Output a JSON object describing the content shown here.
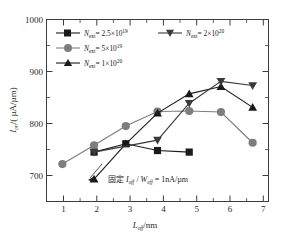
{
  "chart_data": {
    "type": "line",
    "title": "",
    "xlabel": "L_off /nm",
    "ylabel": "I_on /( µA/µm )",
    "x": [
      1,
      2,
      3,
      4,
      5,
      6,
      7
    ],
    "xlim": [
      0.5,
      7.5
    ],
    "ylim": [
      650,
      1000
    ],
    "yticks": [
      700,
      800,
      900,
      1000
    ],
    "xticks": [
      1,
      2,
      3,
      4,
      5,
      6,
      7
    ],
    "grid": false,
    "legend_position": "top-left-inside",
    "annotation": "固定 I off / W eff = 1nA/µm",
    "series": [
      {
        "name": "N_ext = 2.5×10^19",
        "marker": "square",
        "color": "#1a1a1a",
        "x": [
          2,
          3,
          4,
          5
        ],
        "values": [
          745,
          761,
          748,
          745
        ]
      },
      {
        "name": "N_ext = 5×10^19",
        "marker": "circle",
        "color": "#7d7d7d",
        "x": [
          1,
          2,
          3,
          4,
          5,
          6,
          7
        ],
        "values": [
          722,
          758,
          795,
          823,
          824,
          822,
          763
        ]
      },
      {
        "name": "N_ext = 1×10^20",
        "marker": "triangle-up",
        "color": "#1a1a1a",
        "x": [
          2,
          3,
          4,
          5,
          6,
          7
        ],
        "values": [
          693,
          761,
          820,
          857,
          871,
          831
        ]
      },
      {
        "name": "N_ext = 2×10^20",
        "marker": "triangle-down",
        "color": "#3a3a3a",
        "x": [
          2,
          4,
          5,
          6,
          7
        ],
        "values": [
          745,
          768,
          839,
          881,
          873
        ]
      }
    ]
  },
  "axes": {
    "y_ticks": [
      "1000",
      "900",
      "800",
      "700"
    ],
    "x_ticks": [
      "1",
      "2",
      "3",
      "4",
      "5",
      "6",
      "7"
    ],
    "y_label_parts": {
      "sym": "I",
      "sub": "on",
      "unit": "/( µA/µm)"
    },
    "x_label_parts": {
      "sym": "L",
      "sub": "off",
      "unit": "/nm"
    }
  },
  "legend": {
    "entries": [
      {
        "sym": "N",
        "sub": "ext",
        "eq": "= 2.5×10",
        "exp": "19",
        "marker": "square"
      },
      {
        "sym": "N",
        "sub": "ext",
        "eq": "= 2×10",
        "exp": "20",
        "marker": "triangle-down"
      },
      {
        "sym": "N",
        "sub": "ext",
        "eq": "= 5×10",
        "exp": "19",
        "marker": "circle"
      },
      {
        "sym": "N",
        "sub": "ext",
        "eq": "= 1×10",
        "exp": "20",
        "marker": "triangle-up"
      }
    ]
  },
  "annotation": {
    "prefix": "固定 ",
    "i_sym": "I",
    "i_sub": "off",
    "slash": " / ",
    "w_sym": "W",
    "w_sub": "eff",
    "suffix": " = 1nA/µm"
  },
  "colors": {
    "axis": "#3c3c3c",
    "dark": "#1a1a1a",
    "gray": "#7d7d7d",
    "background": "#ffffff"
  }
}
